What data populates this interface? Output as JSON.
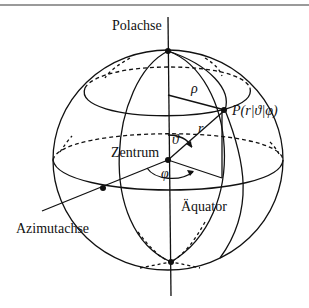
{
  "diagram": {
    "labels": {
      "polar_axis": "Polachse",
      "center": "Zentrum",
      "azimuth_axis": "Azimutachse",
      "equator": "Äquator",
      "point": "P(r|ϑ|φ)",
      "rho": "ρ",
      "r": "r",
      "theta": "ϑ",
      "phi": "φ"
    },
    "colors": {
      "stroke": "#111111",
      "rule": "#9a9a9a",
      "background": "#ffffff"
    }
  }
}
